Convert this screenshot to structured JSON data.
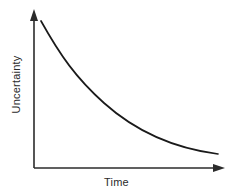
{
  "chart_data": {
    "type": "line",
    "title": "",
    "xlabel": "Time",
    "ylabel": "Uncertainty",
    "x": [
      0,
      0.1,
      0.2,
      0.3,
      0.4,
      0.5,
      0.6,
      0.7,
      0.8,
      0.9,
      1.0
    ],
    "values": [
      1.0,
      0.76,
      0.58,
      0.45,
      0.35,
      0.27,
      0.21,
      0.17,
      0.13,
      0.11,
      0.09
    ],
    "series": [
      {
        "name": "Uncertainty over time",
        "values": [
          1.0,
          0.76,
          0.58,
          0.45,
          0.35,
          0.27,
          0.21,
          0.17,
          0.13,
          0.11,
          0.09
        ]
      }
    ],
    "xlim": [
      0,
      1
    ],
    "ylim": [
      0,
      1.05
    ],
    "grid": false,
    "legend": false,
    "legend_position": "none",
    "xticklabels": [],
    "yticklabels": [],
    "annotations": [],
    "line_color": "#1a1a1a",
    "axis_color": "#2b2b2b",
    "background_color": "#ffffff"
  },
  "axes": {
    "x_axis_name": "Time",
    "y_axis_name": "Uncertainty",
    "x_arrow": "arrow-right",
    "y_arrow": "arrow-up"
  },
  "curve": {
    "path": "M 41 21 C 60 55, 76 78, 104 103 C 133 129, 172 148, 218 154"
  }
}
